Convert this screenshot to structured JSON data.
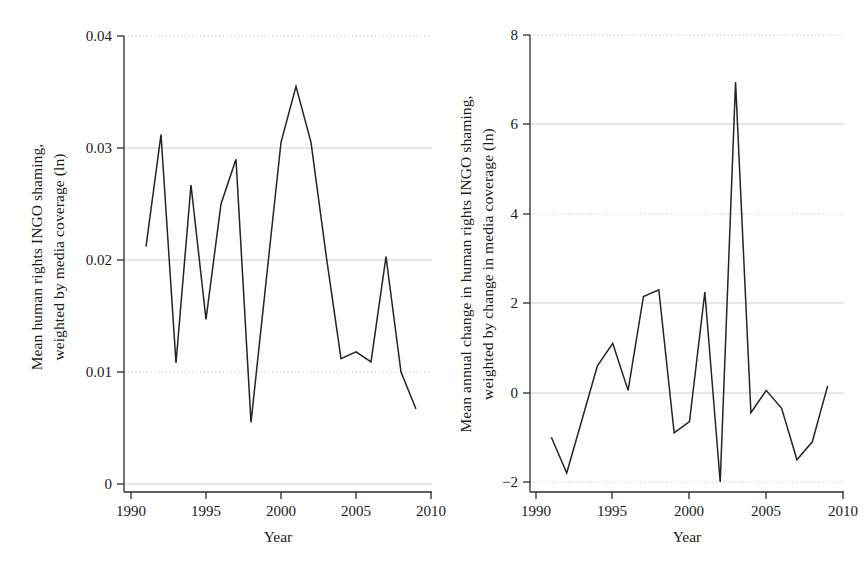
{
  "figure": {
    "panels": [
      {
        "id": "left",
        "ylabel_line1": "Mean human rights INGO shaming,",
        "ylabel_line2": "weighted by media coverage (ln)",
        "xlabel": "Year",
        "ytick_labels": [
          "0.04",
          "0.03",
          "0.02",
          "0.01",
          "0"
        ],
        "xtick_labels": [
          "1990",
          "1995",
          "2000",
          "2005",
          "2010"
        ]
      },
      {
        "id": "right",
        "ylabel_line1": "Mean annual change in human rights INGO shaming,",
        "ylabel_line2": "weighted by change in media coverage (ln)",
        "xlabel": "Year",
        "ytick_labels": [
          "8",
          "6",
          "4",
          "2",
          "0",
          "−2"
        ],
        "xtick_labels": [
          "1990",
          "1995",
          "2000",
          "2005",
          "2010"
        ]
      }
    ],
    "line_color": "#242424",
    "grid_color": "#c9c9c9",
    "axis_color": "#2b2b2b",
    "background": "#ffffff"
  },
  "chart_data": [
    {
      "type": "line",
      "title": "",
      "xlabel": "Year",
      "ylabel": "Mean human rights INGO shaming, weighted by media coverage (ln)",
      "xlim": [
        1990,
        2010
      ],
      "ylim": [
        0,
        0.04
      ],
      "xticks": [
        1990,
        1995,
        2000,
        2005,
        2010
      ],
      "yticks": [
        0,
        0.01,
        0.02,
        0.03,
        0.04
      ],
      "grid": true,
      "legend": "none",
      "x": [
        1991,
        1992,
        1993,
        1994,
        1995,
        1996,
        1997,
        1998,
        1999,
        2000,
        2001,
        2002,
        2003,
        2004,
        2005,
        2006,
        2007,
        2008,
        2009
      ],
      "values": [
        0.0212,
        0.0312,
        0.0108,
        0.0267,
        0.0147,
        0.025,
        0.029,
        0.0055,
        0.018,
        0.0305,
        0.0355,
        0.0305,
        0.0205,
        0.0112,
        0.0118,
        0.0109,
        0.0203,
        0.01,
        0.0067
      ]
    },
    {
      "type": "line",
      "title": "",
      "xlabel": "Year",
      "ylabel": "Mean annual change in human rights INGO shaming, weighted by change in media coverage (ln)",
      "xlim": [
        1990,
        2010
      ],
      "ylim": [
        -2,
        8
      ],
      "xticks": [
        1990,
        1995,
        2000,
        2005,
        2010
      ],
      "yticks": [
        -2,
        0,
        2,
        4,
        6,
        8
      ],
      "grid": true,
      "legend": "none",
      "x": [
        1991,
        1992,
        1993,
        1994,
        1995,
        1996,
        1997,
        1998,
        1999,
        2000,
        2001,
        2002,
        2003,
        2004,
        2005,
        2006,
        2007,
        2008,
        2009
      ],
      "values": [
        -1.0,
        -1.8,
        -0.6,
        0.6,
        1.1,
        0.05,
        2.15,
        2.3,
        -0.9,
        -0.65,
        2.25,
        -2.0,
        6.95,
        -0.45,
        0.05,
        -0.35,
        -1.5,
        -1.1,
        0.15
      ]
    }
  ]
}
